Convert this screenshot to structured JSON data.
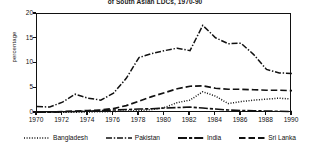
{
  "chart_data": {
    "type": "line",
    "title": "of South Asian LDCs, 1970-90",
    "xlabel": "",
    "ylabel": "percentage",
    "x": [
      1970,
      1971,
      1972,
      1973,
      1974,
      1975,
      1976,
      1977,
      1978,
      1979,
      1980,
      1981,
      1982,
      1983,
      1984,
      1985,
      1986,
      1987,
      1988,
      1989,
      1990
    ],
    "xticks": [
      "1970",
      "1972",
      "1974",
      "1976",
      "1978",
      "1980",
      "1982",
      "1984",
      "1986",
      "1988",
      "1990"
    ],
    "yticks": [
      "0",
      "5",
      "10",
      "15",
      "20"
    ],
    "xlim": [
      1970,
      1990
    ],
    "ylim": [
      0,
      20
    ],
    "grid": false,
    "legend_position": "bottom",
    "series": [
      {
        "name": "Bangladesh",
        "style": "dotted",
        "values": [
          0.1,
          0.1,
          0.15,
          0.15,
          0.2,
          0.25,
          0.3,
          0.4,
          0.5,
          0.7,
          1.1,
          2.1,
          2.6,
          4.3,
          3.4,
          1.9,
          2.3,
          2.6,
          2.8,
          3.0,
          2.8
        ]
      },
      {
        "name": "Pakistan",
        "style": "dash-dot",
        "values": [
          1.3,
          1.2,
          2.2,
          3.8,
          3.0,
          2.6,
          4.0,
          7.0,
          11.2,
          12.0,
          12.6,
          13.1,
          12.6,
          17.7,
          15.2,
          14.0,
          14.1,
          11.8,
          8.8,
          8.1,
          8.0
        ]
      },
      {
        "name": "India",
        "style": "long-dash-short",
        "values": [
          0.1,
          0.15,
          0.2,
          0.3,
          0.35,
          0.5,
          0.6,
          0.7,
          0.8,
          0.85,
          1.0,
          1.1,
          1.2,
          1.0,
          0.8,
          0.6,
          0.5,
          0.45,
          0.4,
          0.35,
          0.3
        ]
      },
      {
        "name": "Sri Lanka",
        "style": "dashed",
        "values": [
          0.2,
          0.2,
          0.3,
          0.4,
          0.5,
          0.6,
          0.9,
          1.5,
          2.4,
          3.3,
          4.1,
          4.9,
          5.4,
          5.5,
          5.0,
          4.8,
          4.8,
          4.7,
          4.6,
          4.6,
          4.5
        ]
      }
    ]
  },
  "legend": {
    "items": [
      {
        "label": "Bangladesh",
        "key": "dotted-line-key"
      },
      {
        "label": "Pakistan",
        "key": "dash-dot-line-key"
      },
      {
        "label": "India",
        "key": "long-dash-short-line-key"
      },
      {
        "label": "Sri Lanka",
        "key": "dashed-line-key"
      }
    ]
  }
}
